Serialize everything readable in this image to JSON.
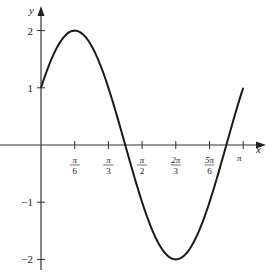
{
  "chart_data": {
    "type": "line",
    "title": "",
    "function": "y = 2 sin(2x + π/6)",
    "xlabel": "x",
    "ylabel": "y",
    "xlim": [
      0,
      3.1416
    ],
    "ylim": [
      -2,
      2
    ],
    "grid": false,
    "legend": null,
    "x_ticks": [
      {
        "value": 0.5236,
        "num": "π",
        "den": "6"
      },
      {
        "value": 1.0472,
        "num": "π",
        "den": "3"
      },
      {
        "value": 1.5708,
        "num": "π",
        "den": "2"
      },
      {
        "value": 2.0944,
        "num": "2π",
        "den": "3"
      },
      {
        "value": 2.618,
        "num": "5π",
        "den": "6"
      },
      {
        "value": 3.1416,
        "num": "π",
        "den": ""
      }
    ],
    "y_ticks": [
      {
        "value": 2,
        "label": "2"
      },
      {
        "value": 1,
        "label": "1"
      },
      {
        "value": -1,
        "label": "−1"
      },
      {
        "value": -2,
        "label": "−2"
      }
    ],
    "series": [
      {
        "name": "2 sin(2x + π/6)",
        "x": [
          0,
          0.2618,
          0.5236,
          0.7854,
          1.0472,
          1.309,
          1.5708,
          1.8326,
          2.0944,
          2.3562,
          2.618,
          2.8798,
          3.1416
        ],
        "y": [
          1,
          1.732,
          2,
          1.732,
          1,
          0,
          -1,
          -1.732,
          -2,
          -1.732,
          -1,
          0,
          1
        ]
      }
    ],
    "key_points": {
      "y_intercept": [
        0,
        1
      ],
      "maximum": [
        0.5236,
        2
      ],
      "zeros": [
        1.309,
        2.8798
      ],
      "minimum": [
        2.0944,
        -2
      ],
      "end": [
        3.1416,
        1
      ]
    }
  },
  "axes": {
    "x_label": "x",
    "y_label": "y"
  }
}
